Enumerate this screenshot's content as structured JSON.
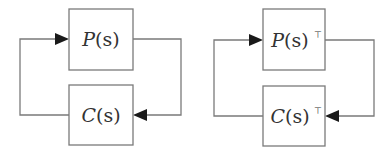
{
  "diagrams": [
    {
      "name": "feedback-loop",
      "plant_label": "P",
      "plant_arg": "(s)",
      "plant_sup": "",
      "controller_label": "C",
      "controller_arg": "(s)",
      "controller_sup": ""
    },
    {
      "name": "transposed-feedback-loop",
      "plant_label": "P",
      "plant_arg": "(s)",
      "plant_sup": "⊤",
      "controller_label": "C",
      "controller_arg": "(s)",
      "controller_sup": "⊤"
    }
  ]
}
